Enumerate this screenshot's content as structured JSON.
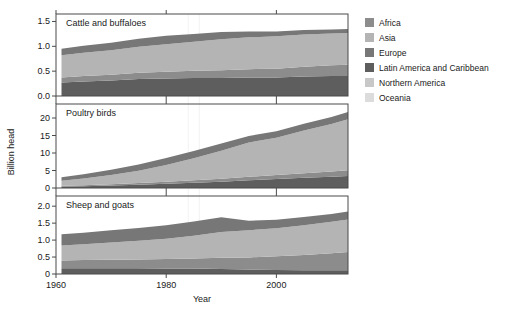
{
  "figure": {
    "ylabel": "Billion head",
    "xlabel": "Year",
    "xticks": [
      "1960",
      "1980",
      "2000"
    ],
    "xtickvals": [
      1960,
      1980,
      2000
    ],
    "xlim": [
      1960,
      2013
    ]
  },
  "legend": {
    "position": "right",
    "items": [
      {
        "label": "Africa",
        "color": "#8c8c8c"
      },
      {
        "label": "Asia",
        "color": "#b4b4b4"
      },
      {
        "label": "Europe",
        "color": "#777777"
      },
      {
        "label": "Latin America and Caribbean",
        "color": "#5e5e5e"
      },
      {
        "label": "Northern America",
        "color": "#c8c8c8"
      },
      {
        "label": "Oceania",
        "color": "#dcdcdc"
      }
    ]
  },
  "chart_data": [
    {
      "type": "area",
      "title": "Cattle and buffaloes",
      "ylabel": "Billion head",
      "xlabel": "Year",
      "ylim": [
        0,
        1.65
      ],
      "yticks": [
        "0.0",
        "0.5",
        "1.0",
        "1.5"
      ],
      "ytickvals": [
        0.0,
        0.5,
        1.0,
        1.5
      ],
      "stacked": true,
      "grid": false,
      "x": [
        1961,
        1965,
        1970,
        1975,
        1980,
        1985,
        1990,
        1995,
        2000,
        2005,
        2010,
        2013
      ],
      "series": [
        {
          "name": "Latin America and Caribbean",
          "color": "#5e5e5e",
          "values": [
            0.27,
            0.29,
            0.31,
            0.34,
            0.35,
            0.36,
            0.36,
            0.37,
            0.37,
            0.39,
            0.4,
            0.4
          ]
        },
        {
          "name": "Africa",
          "color": "#8c8c8c",
          "values": [
            0.1,
            0.11,
            0.12,
            0.13,
            0.14,
            0.15,
            0.16,
            0.17,
            0.18,
            0.2,
            0.22,
            0.23
          ]
        },
        {
          "name": "Asia",
          "color": "#b4b4b4",
          "values": [
            0.45,
            0.47,
            0.49,
            0.52,
            0.55,
            0.58,
            0.62,
            0.64,
            0.65,
            0.65,
            0.64,
            0.64
          ]
        },
        {
          "name": "Europe",
          "color": "#777777",
          "values": [
            0.13,
            0.14,
            0.15,
            0.16,
            0.17,
            0.16,
            0.15,
            0.12,
            0.1,
            0.09,
            0.08,
            0.08
          ]
        },
        {
          "name": "Northern America",
          "color": "#c8c8c8",
          "values": [
            0.0,
            0.0,
            0.0,
            0.0,
            0.0,
            0.0,
            0.0,
            0.0,
            0.0,
            0.0,
            0.0,
            0.0
          ]
        },
        {
          "name": "Oceania",
          "color": "#dcdcdc",
          "values": [
            0.0,
            0.0,
            0.0,
            0.0,
            0.0,
            0.0,
            0.0,
            0.0,
            0.0,
            0.0,
            0.0,
            0.0
          ]
        }
      ]
    },
    {
      "type": "area",
      "title": "Poultry birds",
      "ylabel": "Billion head",
      "xlabel": "Year",
      "ylim": [
        0,
        24
      ],
      "yticks": [
        "0",
        "5",
        "10",
        "15",
        "20"
      ],
      "ytickvals": [
        0,
        5,
        10,
        15,
        20
      ],
      "stacked": true,
      "grid": false,
      "x": [
        1961,
        1965,
        1970,
        1975,
        1980,
        1985,
        1990,
        1995,
        2000,
        2005,
        2010,
        2013
      ],
      "series": [
        {
          "name": "Latin America and Caribbean",
          "color": "#5e5e5e",
          "values": [
            0.4,
            0.5,
            0.7,
            0.95,
            1.2,
            1.5,
            1.8,
            2.2,
            2.6,
            2.9,
            3.2,
            3.4
          ]
        },
        {
          "name": "Africa",
          "color": "#8c8c8c",
          "values": [
            0.25,
            0.3,
            0.38,
            0.48,
            0.6,
            0.72,
            0.85,
            1.0,
            1.15,
            1.3,
            1.5,
            1.65
          ]
        },
        {
          "name": "Asia",
          "color": "#b4b4b4",
          "values": [
            1.4,
            1.9,
            2.6,
            3.5,
            4.8,
            6.3,
            8.0,
            9.8,
            10.6,
            12.2,
            13.6,
            14.6
          ]
        },
        {
          "name": "Europe",
          "color": "#777777",
          "values": [
            1.05,
            1.25,
            1.5,
            1.75,
            1.95,
            2.05,
            2.1,
            1.85,
            1.9,
            1.95,
            2.0,
            2.05
          ]
        },
        {
          "name": "Northern America",
          "color": "#c8c8c8",
          "values": [
            0.0,
            0.0,
            0.0,
            0.0,
            0.0,
            0.0,
            0.0,
            0.0,
            0.0,
            0.0,
            0.0,
            0.0
          ]
        },
        {
          "name": "Oceania",
          "color": "#dcdcdc",
          "values": [
            0.0,
            0.0,
            0.0,
            0.0,
            0.0,
            0.0,
            0.0,
            0.0,
            0.0,
            0.0,
            0.0,
            0.0
          ]
        }
      ]
    },
    {
      "type": "area",
      "title": "Sheep and goats",
      "ylabel": "Billion head",
      "xlabel": "Year",
      "ylim": [
        0,
        2.3
      ],
      "yticks": [
        "0",
        "0.5",
        "1.0",
        "1.5",
        "2.0"
      ],
      "ytickvals": [
        0,
        0.5,
        1.0,
        1.5,
        2.0
      ],
      "stacked": true,
      "grid": false,
      "x": [
        1961,
        1965,
        1970,
        1975,
        1980,
        1985,
        1990,
        1995,
        2000,
        2005,
        2010,
        2013
      ],
      "series": [
        {
          "name": "Latin America and Caribbean",
          "color": "#5e5e5e",
          "values": [
            0.17,
            0.17,
            0.17,
            0.17,
            0.16,
            0.16,
            0.15,
            0.13,
            0.12,
            0.11,
            0.11,
            0.11
          ]
        },
        {
          "name": "Africa",
          "color": "#8c8c8c",
          "values": [
            0.23,
            0.24,
            0.25,
            0.26,
            0.28,
            0.3,
            0.33,
            0.36,
            0.4,
            0.45,
            0.5,
            0.54
          ]
        },
        {
          "name": "Asia",
          "color": "#b4b4b4",
          "values": [
            0.44,
            0.47,
            0.51,
            0.55,
            0.6,
            0.67,
            0.76,
            0.8,
            0.83,
            0.88,
            0.93,
            0.96
          ]
        },
        {
          "name": "Europe",
          "color": "#777777",
          "values": [
            0.33,
            0.34,
            0.36,
            0.38,
            0.4,
            0.42,
            0.43,
            0.28,
            0.25,
            0.24,
            0.23,
            0.23
          ]
        },
        {
          "name": "Northern America",
          "color": "#c8c8c8",
          "values": [
            0.0,
            0.0,
            0.0,
            0.0,
            0.0,
            0.0,
            0.0,
            0.0,
            0.0,
            0.0,
            0.0,
            0.0
          ]
        },
        {
          "name": "Oceania",
          "color": "#dcdcdc",
          "values": [
            0.0,
            0.0,
            0.0,
            0.0,
            0.0,
            0.0,
            0.0,
            0.0,
            0.0,
            0.0,
            0.0,
            0.0
          ]
        }
      ]
    }
  ]
}
